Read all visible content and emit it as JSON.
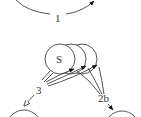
{
  "diagram": {
    "type": "state-transition",
    "nodes": [
      {
        "id": "S",
        "label": "S"
      },
      {
        "id": "bottom-left",
        "label": ""
      },
      {
        "id": "bottom-right",
        "label": ""
      }
    ],
    "edges": [
      {
        "label": "1",
        "description": "top arc arrow"
      },
      {
        "label": "3",
        "description": "from S stack to bottom-left node (open arrowhead)"
      },
      {
        "label": "2b",
        "description": "from bottom-right toward S stack (filled arrowheads)"
      }
    ],
    "colors": {
      "stroke": "#444444",
      "background": "#ffffff",
      "text": "#333333"
    }
  }
}
